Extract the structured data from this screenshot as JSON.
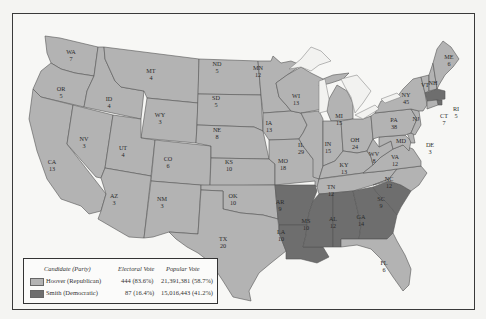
{
  "map": {
    "title": "Election of 1928",
    "colors": {
      "republican": "#b3b3b3",
      "democratic": "#6e6e6e",
      "water": "#f2f2f0",
      "border": "#555555"
    },
    "states": [
      {
        "abbr": "WA",
        "ev": "7",
        "party": "Hoover"
      },
      {
        "abbr": "OR",
        "ev": "5",
        "party": "Hoover"
      },
      {
        "abbr": "CA",
        "ev": "13",
        "party": "Hoover"
      },
      {
        "abbr": "ID",
        "ev": "4",
        "party": "Hoover"
      },
      {
        "abbr": "NV",
        "ev": "3",
        "party": "Hoover"
      },
      {
        "abbr": "MT",
        "ev": "4",
        "party": "Hoover"
      },
      {
        "abbr": "WY",
        "ev": "3",
        "party": "Hoover"
      },
      {
        "abbr": "UT",
        "ev": "4",
        "party": "Hoover"
      },
      {
        "abbr": "AZ",
        "ev": "3",
        "party": "Hoover"
      },
      {
        "abbr": "CO",
        "ev": "6",
        "party": "Hoover"
      },
      {
        "abbr": "NM",
        "ev": "3",
        "party": "Hoover"
      },
      {
        "abbr": "ND",
        "ev": "5",
        "party": "Hoover"
      },
      {
        "abbr": "SD",
        "ev": "5",
        "party": "Hoover"
      },
      {
        "abbr": "NE",
        "ev": "8",
        "party": "Hoover"
      },
      {
        "abbr": "KS",
        "ev": "10",
        "party": "Hoover"
      },
      {
        "abbr": "OK",
        "ev": "10",
        "party": "Hoover"
      },
      {
        "abbr": "TX",
        "ev": "20",
        "party": "Hoover"
      },
      {
        "abbr": "MN",
        "ev": "12",
        "party": "Hoover"
      },
      {
        "abbr": "IA",
        "ev": "13",
        "party": "Hoover"
      },
      {
        "abbr": "MO",
        "ev": "18",
        "party": "Hoover"
      },
      {
        "abbr": "AR",
        "ev": "9",
        "party": "Smith"
      },
      {
        "abbr": "LA",
        "ev": "10",
        "party": "Smith"
      },
      {
        "abbr": "WI",
        "ev": "13",
        "party": "Hoover"
      },
      {
        "abbr": "IL",
        "ev": "29",
        "party": "Hoover"
      },
      {
        "abbr": "MI",
        "ev": "15",
        "party": "Hoover"
      },
      {
        "abbr": "IN",
        "ev": "15",
        "party": "Hoover"
      },
      {
        "abbr": "OH",
        "ev": "24",
        "party": "Hoover"
      },
      {
        "abbr": "KY",
        "ev": "13",
        "party": "Hoover"
      },
      {
        "abbr": "TN",
        "ev": "12",
        "party": "Hoover"
      },
      {
        "abbr": "MS",
        "ev": "10",
        "party": "Smith"
      },
      {
        "abbr": "AL",
        "ev": "12",
        "party": "Smith"
      },
      {
        "abbr": "GA",
        "ev": "14",
        "party": "Smith"
      },
      {
        "abbr": "FL",
        "ev": "6",
        "party": "Hoover"
      },
      {
        "abbr": "SC",
        "ev": "9",
        "party": "Smith"
      },
      {
        "abbr": "NC",
        "ev": "12",
        "party": "Hoover"
      },
      {
        "abbr": "VA",
        "ev": "12",
        "party": "Hoover"
      },
      {
        "abbr": "WV",
        "ev": "8",
        "party": "Hoover"
      },
      {
        "abbr": "MD",
        "ev": "8",
        "party": "Hoover"
      },
      {
        "abbr": "DE",
        "ev": "3",
        "party": "Hoover"
      },
      {
        "abbr": "PA",
        "ev": "38",
        "party": "Hoover"
      },
      {
        "abbr": "NJ",
        "ev": "14",
        "party": "Hoover"
      },
      {
        "abbr": "NY",
        "ev": "45",
        "party": "Hoover"
      },
      {
        "abbr": "CT",
        "ev": "7",
        "party": "Hoover"
      },
      {
        "abbr": "RI",
        "ev": "5",
        "party": "Smith"
      },
      {
        "abbr": "MA",
        "ev": "18",
        "party": "Smith"
      },
      {
        "abbr": "VT",
        "ev": "4",
        "party": "Hoover"
      },
      {
        "abbr": "NH",
        "ev": "4",
        "party": "Hoover"
      },
      {
        "abbr": "ME",
        "ev": "6",
        "party": "Hoover"
      }
    ]
  },
  "legend": {
    "headers": {
      "candidate": "Candidate (Party)",
      "electoral": "Electoral Vote",
      "popular": "Popular Vote"
    },
    "rows": [
      {
        "candidate": "Hoover (Republican)",
        "electoral": "444 (83.6%)",
        "popular": "21,391,381 (58.7%)",
        "color": "#b3b3b3"
      },
      {
        "candidate": "Smith (Democratic)",
        "electoral": "87 (16.4%)",
        "popular": "15,016,443 (41.2%)",
        "color": "#6e6e6e"
      }
    ]
  }
}
